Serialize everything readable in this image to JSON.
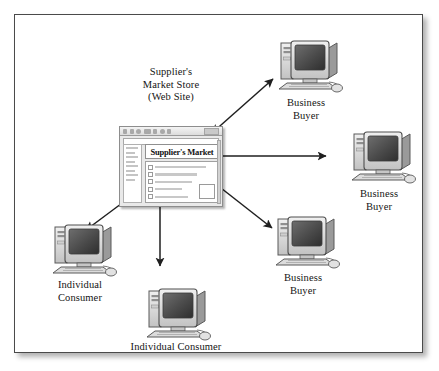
{
  "diagram": {
    "title_label": "Supplier's\nMarket Store\n(Web Site)",
    "frame_name": "diagram-frame"
  },
  "browser": {
    "site_title": "Supplier's Market",
    "toolbar_icons": [
      "back-icon",
      "forward-icon",
      "stop-icon",
      "reload-icon",
      "home-icon",
      "search-icon",
      "print-icon",
      "address-box"
    ],
    "list_items": [
      "list-row-1",
      "list-row-2",
      "list-row-3",
      "list-row-4",
      "list-row-5"
    ],
    "sidebar_rows": 8,
    "thumbnail_name": "product-thumbnail"
  },
  "nodes": [
    {
      "id": "business-buyer-top",
      "label": "Business\nBuyer",
      "type": "computer"
    },
    {
      "id": "business-buyer-right",
      "label": "Business\nBuyer",
      "type": "computer"
    },
    {
      "id": "business-buyer-bottom",
      "label": "Business\nBuyer",
      "type": "computer"
    },
    {
      "id": "individual-consumer-left",
      "label": "Individual\nConsumer",
      "type": "computer"
    },
    {
      "id": "individual-consumer-bottom",
      "label": "Individual Consumer",
      "type": "computer"
    }
  ],
  "connections": [
    {
      "id": "link-store-business-top",
      "from": "supplier-store",
      "to": "business-buyer-top",
      "style": "double-arrow"
    },
    {
      "id": "link-store-business-right",
      "from": "supplier-store",
      "to": "business-buyer-right",
      "style": "double-arrow"
    },
    {
      "id": "link-store-business-bottom",
      "from": "supplier-store",
      "to": "business-buyer-bottom",
      "style": "double-arrow"
    },
    {
      "id": "link-store-consumer-left",
      "from": "supplier-store",
      "to": "individual-consumer-left",
      "style": "double-arrow"
    },
    {
      "id": "link-store-consumer-bottom",
      "from": "supplier-store",
      "to": "individual-consumer-bottom",
      "style": "double-arrow"
    }
  ],
  "colors": {
    "frame_border": "#4a4a4a",
    "background": "#ffffff",
    "arrow": "#1f1f1f",
    "case_light": "#e6e6e6",
    "case_mid": "#b8b8b8",
    "case_dark": "#8a8a8a",
    "screen_dark": "#3a3a3a"
  }
}
